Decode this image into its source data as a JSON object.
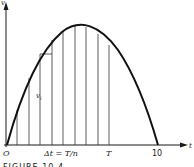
{
  "figure": {
    "caption": "FIGURE 10.4",
    "y_axis_label": "v",
    "x_axis_label": "t",
    "origin_label": "O",
    "interval_label": "Δt = T/n",
    "T_label": "T",
    "end_label": "10",
    "height_label": "v",
    "height_subscript": "i"
  },
  "geometry": {
    "origin": [
      7,
      145
    ],
    "curve_end_x": 158,
    "peak": [
      78,
      26
    ],
    "vertical_lines_x": [
      17,
      29,
      40,
      52,
      63,
      75,
      86,
      98,
      109
    ],
    "step": {
      "x1": 40,
      "x2": 52,
      "y": 54
    }
  }
}
